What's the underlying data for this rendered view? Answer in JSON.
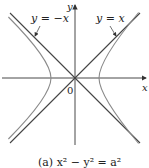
{
  "figure": {
    "type": "hyperbola-plot",
    "caption": "(a)  x² − y² = a²",
    "axes": {
      "x_label": "x",
      "y_label": "y",
      "origin_label": "0"
    },
    "asymptotes": [
      {
        "label": "y = −x"
      },
      {
        "label": "y = x"
      }
    ],
    "colors": {
      "axis": "#333333",
      "asymptote": "#444444",
      "hyperbola": "#8a8a8a"
    }
  }
}
